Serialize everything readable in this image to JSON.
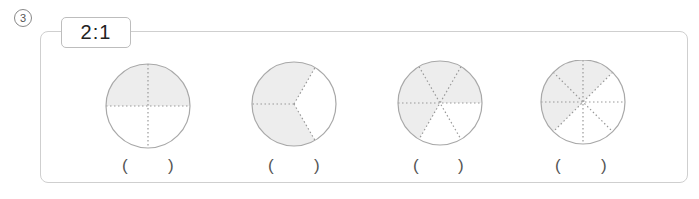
{
  "question": {
    "number_label": "3",
    "ratio_label": "2:1"
  },
  "style": {
    "shade_color": "#ededed",
    "line_color": "#999999",
    "circle_stroke": "#a8a8a8",
    "frame_border": "#cfcfcf"
  },
  "circles": [
    {
      "id": 1,
      "divisions": 4,
      "shaded_parts": 2,
      "answer_left": "(",
      "answer_right": ")"
    },
    {
      "id": 2,
      "divisions": 3,
      "shaded_parts": 2,
      "answer_left": "(",
      "answer_right": ")"
    },
    {
      "id": 3,
      "divisions": 6,
      "shaded_parts": 4,
      "answer_left": "(",
      "answer_right": ")"
    },
    {
      "id": 4,
      "divisions": 8,
      "shaded_parts": 4,
      "answer_left": "(",
      "answer_right": ")"
    }
  ]
}
